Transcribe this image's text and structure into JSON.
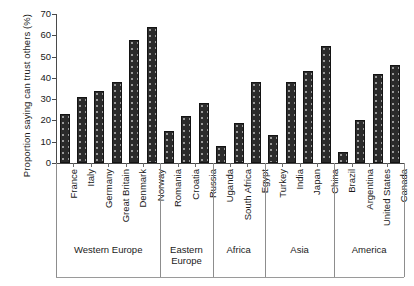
{
  "chart_data": {
    "type": "bar",
    "title": "",
    "xlabel": "",
    "ylabel": "Proportion saying can trust others (%)",
    "ylim": [
      0,
      70
    ],
    "yticks": [
      0,
      10,
      20,
      30,
      40,
      50,
      60,
      70
    ],
    "grid": false,
    "legend": "none",
    "bar_color": "#2b2b2b",
    "bar_pattern": "dotted-fill",
    "categories": [
      "France",
      "Italy",
      "Germany",
      "Great Britain",
      "Denmark",
      "Norway",
      "Romania",
      "Croatia",
      "Russia",
      "Uganda",
      "South Africa",
      "Egypt",
      "Turkey",
      "India",
      "Japan",
      "China",
      "Brazil",
      "Argentina",
      "United States",
      "Canada"
    ],
    "values": [
      23,
      31,
      34,
      38,
      58,
      64,
      15,
      22,
      28,
      8,
      19,
      38,
      13,
      38,
      43,
      55,
      5,
      20,
      42,
      46
    ],
    "groups": [
      {
        "label": "Western Europe",
        "start": 0,
        "end": 5
      },
      {
        "label": "Eastern Europe",
        "start": 6,
        "end": 8
      },
      {
        "label": "Africa",
        "start": 9,
        "end": 11
      },
      {
        "label": "Asia",
        "start": 12,
        "end": 15
      },
      {
        "label": "America",
        "start": 16,
        "end": 19
      }
    ]
  }
}
